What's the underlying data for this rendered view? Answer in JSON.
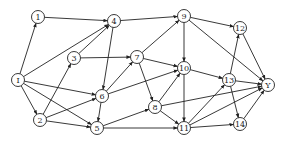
{
  "diagram": {
    "type": "directed-graph",
    "nodes": [
      {
        "id": "I",
        "label": "I"
      },
      {
        "id": "1",
        "label": "1"
      },
      {
        "id": "2",
        "label": "2"
      },
      {
        "id": "3",
        "label": "3"
      },
      {
        "id": "4",
        "label": "4"
      },
      {
        "id": "5",
        "label": "5"
      },
      {
        "id": "6",
        "label": "6"
      },
      {
        "id": "7",
        "label": "7"
      },
      {
        "id": "8",
        "label": "8"
      },
      {
        "id": "9",
        "label": "9"
      },
      {
        "id": "10",
        "label": "10"
      },
      {
        "id": "11",
        "label": "11"
      },
      {
        "id": "12",
        "label": "12"
      },
      {
        "id": "13",
        "label": "13"
      },
      {
        "id": "14",
        "label": "14"
      },
      {
        "id": "Y",
        "label": "Y"
      }
    ],
    "edges": [
      [
        "I",
        "1"
      ],
      [
        "I",
        "4"
      ],
      [
        "I",
        "2"
      ],
      [
        "I",
        "6"
      ],
      [
        "I",
        "5"
      ],
      [
        "1",
        "4"
      ],
      [
        "2",
        "3"
      ],
      [
        "2",
        "6"
      ],
      [
        "2",
        "5"
      ],
      [
        "3",
        "4"
      ],
      [
        "3",
        "7"
      ],
      [
        "4",
        "9"
      ],
      [
        "4",
        "6"
      ],
      [
        "6",
        "5"
      ],
      [
        "6",
        "7"
      ],
      [
        "6",
        "10"
      ],
      [
        "5",
        "8"
      ],
      [
        "5",
        "11"
      ],
      [
        "7",
        "9"
      ],
      [
        "7",
        "10"
      ],
      [
        "7",
        "8"
      ],
      [
        "8",
        "10"
      ],
      [
        "8",
        "11"
      ],
      [
        "8",
        "Y"
      ],
      [
        "9",
        "10"
      ],
      [
        "9",
        "12"
      ],
      [
        "9",
        "Y"
      ],
      [
        "10",
        "11"
      ],
      [
        "10",
        "13"
      ],
      [
        "11",
        "13"
      ],
      [
        "11",
        "14"
      ],
      [
        "11",
        "Y"
      ],
      [
        "13",
        "12"
      ],
      [
        "13",
        "14"
      ],
      [
        "13",
        "Y"
      ],
      [
        "12",
        "Y"
      ],
      [
        "14",
        "Y"
      ]
    ]
  }
}
